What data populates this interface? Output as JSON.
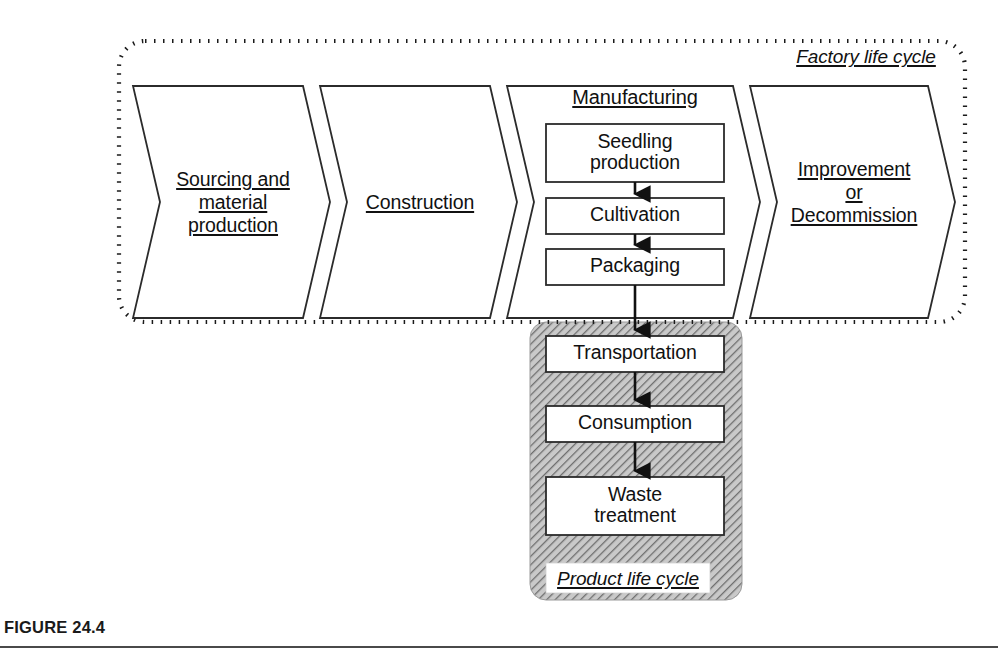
{
  "figure": {
    "caption": "FIGURE 24.4",
    "number": "24.4"
  },
  "factory_life_cycle": {
    "label": "Factory life cycle",
    "stages": [
      {
        "id": "sourcing",
        "lines": [
          "Sourcing and",
          "material",
          "production"
        ]
      },
      {
        "id": "construction",
        "lines": [
          "Construction"
        ]
      },
      {
        "id": "manufacturing",
        "lines": [
          "Manufacturing"
        ]
      },
      {
        "id": "improvement",
        "lines": [
          "Improvement",
          "or",
          "Decommission"
        ]
      }
    ]
  },
  "manufacturing": {
    "heading": "Manufacturing",
    "steps": [
      {
        "id": "seedling",
        "lines": [
          "Seedling",
          "production"
        ]
      },
      {
        "id": "cultivation",
        "lines": [
          "Cultivation"
        ]
      },
      {
        "id": "packaging",
        "lines": [
          "Packaging"
        ]
      }
    ]
  },
  "product_life_cycle": {
    "label": "Product life cycle",
    "steps": [
      {
        "id": "transportation",
        "lines": [
          "Transportation"
        ]
      },
      {
        "id": "consumption",
        "lines": [
          "Consumption"
        ]
      },
      {
        "id": "waste",
        "lines": [
          "Waste",
          "treatment"
        ]
      }
    ]
  },
  "colors": {
    "stroke": "#1a1a1a",
    "panel_fill": "#b0b0b0",
    "panel_hatch": "#6e6e6e",
    "box_fill": "#ffffff",
    "background": "#ffffff",
    "caption_rule": "#4a4a4a"
  }
}
